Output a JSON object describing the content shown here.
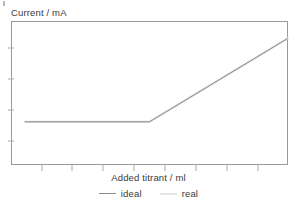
{
  "chart_data": {
    "type": "line",
    "title": "",
    "xlabel": "Added titrant / ml",
    "ylabel": "Current / mA",
    "grid": false,
    "legend_position": "bottom-center",
    "xlim": [
      0,
      10
    ],
    "ylim": [
      0,
      10
    ],
    "x_ticks": [
      1,
      2,
      3,
      4,
      5,
      6,
      7,
      8,
      9
    ],
    "x_tick_labels": [
      "",
      "",
      "",
      "",
      "",
      "",
      "",
      "",
      ""
    ],
    "y_ticks": [
      2,
      4,
      6,
      8
    ],
    "y_tick_labels": [
      "",
      "",
      "",
      ""
    ],
    "equivalence_point_x": 5.0,
    "series": [
      {
        "name": "ideal",
        "color": "#8c8c8c",
        "x": [
          0.5,
          5.0,
          10.0
        ],
        "y": [
          3.0,
          3.0,
          8.8
        ]
      },
      {
        "name": "real",
        "color": "#e2e2e2",
        "x": [
          0.5,
          5.0,
          10.0
        ],
        "y": [
          3.0,
          3.0,
          8.8
        ]
      }
    ],
    "legend_entries": [
      {
        "label": "ideal",
        "color": "#8c8c8c"
      },
      {
        "label": "real",
        "color": "#e6e6e6"
      }
    ]
  },
  "figure": {
    "y_axis_title": "Current / mA",
    "x_axis_title": "Added titrant / ml",
    "frame_color": "#9a9a9a",
    "background": "#ffffff"
  },
  "legend": {
    "ideal_label": "ideal",
    "real_label": "real"
  }
}
